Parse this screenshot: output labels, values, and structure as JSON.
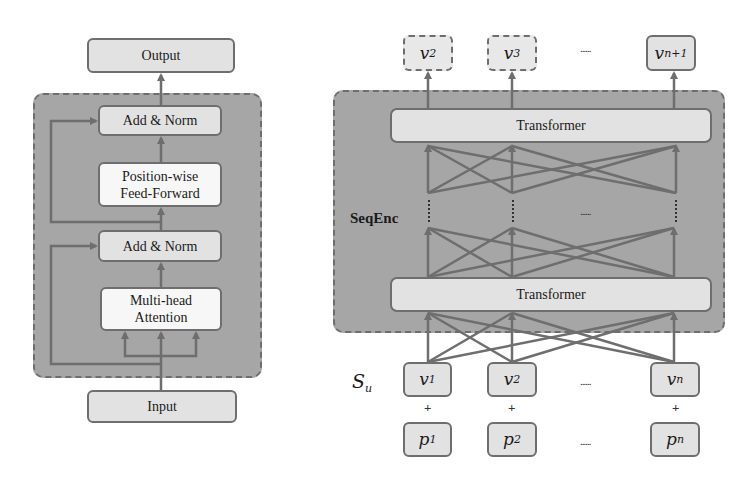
{
  "left_panel": {
    "output_label": "Output",
    "input_label": "Input",
    "blocks": [
      {
        "label": "Add & Norm"
      },
      {
        "label_line1": "Position-wise",
        "label_line2": "Feed-Forward"
      },
      {
        "label": "Add & Norm"
      },
      {
        "label_line1": "Multi-head",
        "label_line2": "Attention"
      }
    ]
  },
  "right_panel": {
    "encoder_label": "SeqEnc",
    "transformer_top_label": "Transformer",
    "transformer_bottom_label": "Transformer",
    "sequence_label": {
      "base": "S",
      "sub": "u"
    },
    "outputs": [
      {
        "base": "v",
        "sub": "2",
        "style": "dashed"
      },
      {
        "base": "v",
        "sub": "3",
        "style": "dashed"
      },
      {
        "base": "v",
        "sub": "n+1",
        "style": "solid"
      }
    ],
    "items": [
      {
        "base": "v",
        "sub": "1"
      },
      {
        "base": "v",
        "sub": "2"
      },
      {
        "base": "v",
        "sub": "n"
      }
    ],
    "positions": [
      {
        "base": "p",
        "sub": "1"
      },
      {
        "base": "p",
        "sub": "2"
      },
      {
        "base": "p",
        "sub": "n"
      }
    ],
    "ellipsis": "......",
    "plus": "+"
  },
  "colors": {
    "container_fill": "#a6a6a6",
    "box_fill_light": "#e2e2e2",
    "box_fill_white": "#f7f7f7",
    "stroke": "#6e6e6e"
  }
}
